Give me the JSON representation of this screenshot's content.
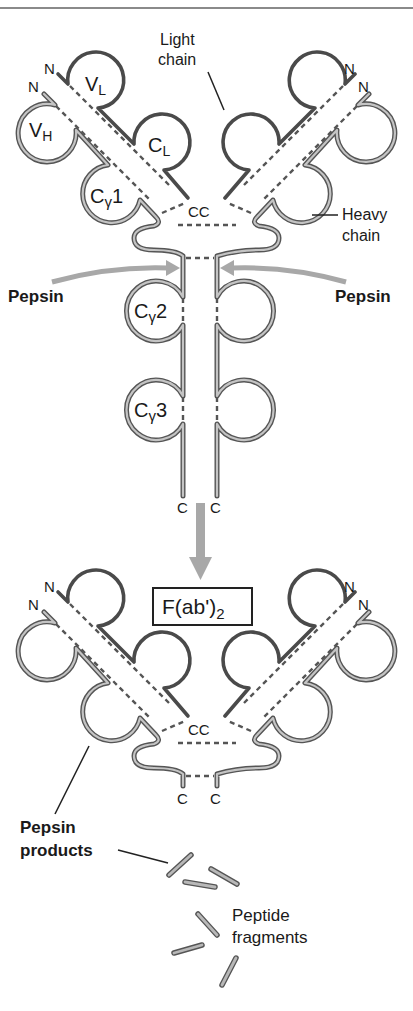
{
  "figure": {
    "top_antibody": {
      "n_terminus_labels": [
        "N",
        "N",
        "N",
        "N"
      ],
      "domain_labels": {
        "vl": {
          "main": "V",
          "sub": "L"
        },
        "vh": {
          "main": "V",
          "sub": "H"
        },
        "cl": {
          "main": "C",
          "sub": "L"
        },
        "cg1": {
          "main": "C",
          "greek": "γ",
          "num": "1"
        },
        "cg2": {
          "main": "C",
          "greek": "γ",
          "num": "2"
        },
        "cg3": {
          "main": "C",
          "greek": "γ",
          "num": "3"
        }
      },
      "cc_label": "CC",
      "c_terminus_labels": [
        "C",
        "C"
      ],
      "callouts": {
        "light_chain": [
          "Light",
          "chain"
        ],
        "heavy_chain": [
          "Heavy",
          "chain"
        ]
      }
    },
    "enzyme": {
      "left_label": "Pepsin",
      "right_label": "Pepsin"
    },
    "bottom_antibody": {
      "box_label": {
        "main": "F(ab')",
        "sub": "2"
      },
      "n_terminus_labels": [
        "N",
        "N",
        "N",
        "N"
      ],
      "cc_label": "CC",
      "c_terminus_labels": [
        "C",
        "C"
      ]
    },
    "products": {
      "pepsin_products": [
        "Pepsin",
        "products"
      ],
      "peptide_fragments": [
        "Peptide",
        "fragments"
      ]
    },
    "colors": {
      "light_chain": "#4a4a4a",
      "heavy_chain_fill": "#b8b8b8",
      "heavy_chain_outline": "#555555",
      "arrow": "#a8a8a8",
      "text": "#1a1a1a"
    }
  }
}
